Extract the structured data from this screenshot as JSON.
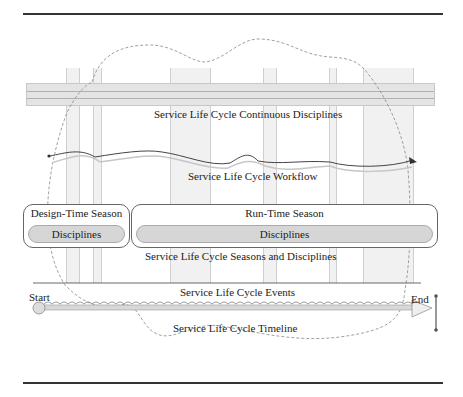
{
  "diagram": {
    "continuous_disciplines_label": "Service Life Cycle Continuous Disciplines",
    "workflow_label": "Service Life Cycle Workflow",
    "seasons_label": "Service Life Cycle Seasons and Disciplines",
    "events_label": "Service Life Cycle Events",
    "timeline_label": "Service Life Cycle Timeline",
    "start_label": "Start",
    "end_label": "End",
    "seasons": [
      {
        "title": "Design-Time Season",
        "disciplines_label": "Disciplines"
      },
      {
        "title": "Run-Time Season",
        "disciplines_label": "Disciplines"
      }
    ]
  }
}
